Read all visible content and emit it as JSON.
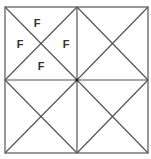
{
  "diagram": {
    "stroke_color": "#555555",
    "outer_box": {
      "x1": 5,
      "y1": 7,
      "x2": 148,
      "y2": 153
    },
    "center": {
      "x": 77,
      "y": 80
    },
    "labels": [
      {
        "text": "F",
        "position": "top-left quadrant, top triangle"
      },
      {
        "text": "F",
        "position": "top-left quadrant, left triangle"
      },
      {
        "text": "F",
        "position": "top-left quadrant, right triangle"
      },
      {
        "text": "F",
        "position": "top-left quadrant, bottom triangle"
      }
    ]
  }
}
